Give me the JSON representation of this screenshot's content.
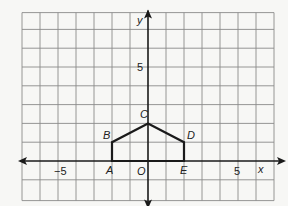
{
  "chart_data": {
    "type": "line",
    "title": "",
    "xlabel": "x",
    "ylabel": "y",
    "xlim": [
      -7,
      7
    ],
    "ylim": [
      -2,
      8
    ],
    "grid": true,
    "x_tick_labels": [
      {
        "value": -5,
        "label": "−5"
      },
      {
        "value": 5,
        "label": "5"
      }
    ],
    "y_tick_labels": [
      {
        "value": 5,
        "label": "5"
      }
    ],
    "origin_label": "O",
    "series": [
      {
        "name": "polygon ABCDE",
        "closed": true,
        "points": [
          {
            "label": "A",
            "x": -2,
            "y": 0
          },
          {
            "label": "B",
            "x": -2,
            "y": 1
          },
          {
            "label": "C",
            "x": 0,
            "y": 2
          },
          {
            "label": "D",
            "x": 2,
            "y": 1
          },
          {
            "label": "E",
            "x": 2,
            "y": 0
          }
        ]
      }
    ]
  },
  "colors": {
    "background": "#f7f7f5",
    "grid": "#8a8a8a",
    "axis": "#1a1a1a",
    "shape": "#1a1a1a"
  }
}
